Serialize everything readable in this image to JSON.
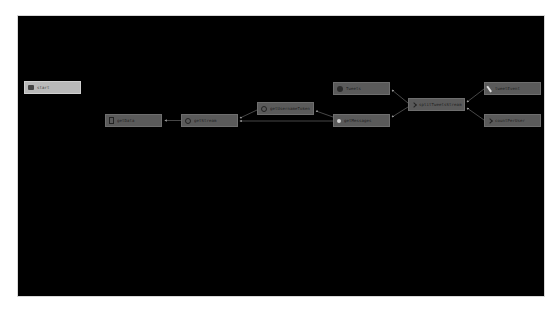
{
  "graph": {
    "background": "#000000",
    "node_color": "#5a5a5a",
    "selected_node_color": "#b9b9b9",
    "edge_color": "#9a9a9a",
    "nodes": [
      {
        "id": "n0",
        "label": "start",
        "icon": "start-icon",
        "selected": true
      },
      {
        "id": "n1",
        "label": "getData",
        "icon": "document-icon"
      },
      {
        "id": "n2",
        "label": "getStream",
        "icon": "gear-icon"
      },
      {
        "id": "n3",
        "label": "getUsernameToken",
        "icon": "gear-icon"
      },
      {
        "id": "n4",
        "label": "Tweets",
        "icon": "globe-icon"
      },
      {
        "id": "n5",
        "label": "getMessages",
        "icon": "dot-icon"
      },
      {
        "id": "n6",
        "label": "splitTweetsStream",
        "icon": "arrow-icon"
      },
      {
        "id": "n7",
        "label": "tweetEvent",
        "icon": "pen-icon"
      },
      {
        "id": "n8",
        "label": "countPerUser",
        "icon": "arrow-icon"
      }
    ],
    "edges": [
      {
        "from": "n2",
        "to": "n1"
      },
      {
        "from": "n3",
        "to": "n2"
      },
      {
        "from": "n5",
        "to": "n2"
      },
      {
        "from": "n5",
        "to": "n3"
      },
      {
        "from": "n6",
        "to": "n4"
      },
      {
        "from": "n6",
        "to": "n5"
      },
      {
        "from": "n7",
        "to": "n6"
      },
      {
        "from": "n8",
        "to": "n6"
      }
    ]
  }
}
